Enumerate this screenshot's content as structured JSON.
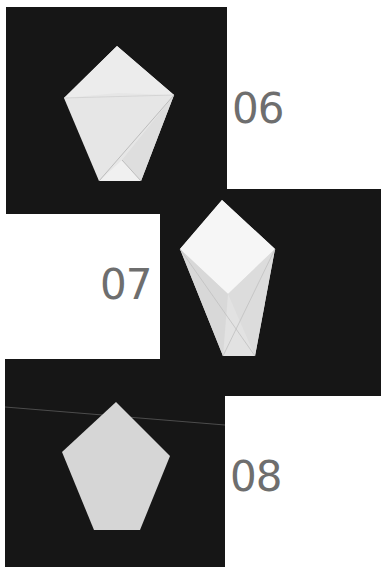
{
  "steps": [
    {
      "number": "06",
      "shape": "pentagon-with-folded-flap",
      "paper_color": "#e9e9e9"
    },
    {
      "number": "07",
      "shape": "pentagon-with-square-top",
      "paper_color": "#f4f4f4"
    },
    {
      "number": "08",
      "shape": "pentagon-flat",
      "paper_color": "#d6d6d6"
    }
  ],
  "colors": {
    "background": "#ffffff",
    "panel": "#161616",
    "step_number": "#6e6e6e"
  }
}
